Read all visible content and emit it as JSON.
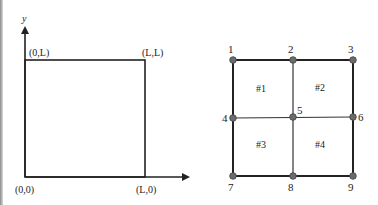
{
  "left_panel": {
    "axis_labels": {
      "y": "y"
    },
    "corner_labels": {
      "top_left": "(0,L)",
      "top_right": "(L,L)",
      "bottom_left": "(0,0)",
      "bottom_right": "(L,0)"
    }
  },
  "right_panel": {
    "nodes": [
      {
        "id": "1",
        "label": "1"
      },
      {
        "id": "2",
        "label": "2"
      },
      {
        "id": "3",
        "label": "3"
      },
      {
        "id": "4",
        "label": "4"
      },
      {
        "id": "5",
        "label": "5"
      },
      {
        "id": "6",
        "label": "6"
      },
      {
        "id": "7",
        "label": "7"
      },
      {
        "id": "8",
        "label": "8"
      },
      {
        "id": "9",
        "label": "9"
      }
    ],
    "elements": [
      {
        "label": "#1"
      },
      {
        "label": "#2"
      },
      {
        "label": "#3"
      },
      {
        "label": "#4"
      }
    ]
  },
  "colors": {
    "line": "#222222",
    "node_fill": "#6b6b6b",
    "node_stroke": "#444444",
    "text": "#222222"
  }
}
